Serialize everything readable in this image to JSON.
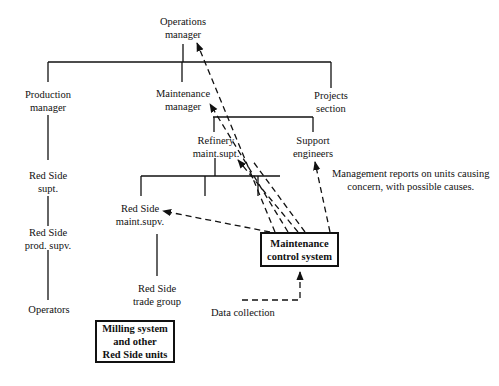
{
  "diagram": {
    "type": "organization-chart-with-information-flows",
    "nodes": {
      "operations_manager": {
        "line1": "Operations",
        "line2": "manager"
      },
      "production_manager": {
        "line1": "Production",
        "line2": "manager"
      },
      "maintenance_manager": {
        "line1": "Maintenance",
        "line2": "manager"
      },
      "projects_section": {
        "line1": "Projects",
        "line2": "section"
      },
      "refinery_maint_supt": {
        "line1": "Refinery",
        "line2": "maint.supt."
      },
      "support_engineers": {
        "line1": "Support",
        "line2": "engineers"
      },
      "red_side_supt": {
        "line1": "Red Side",
        "line2": "supt."
      },
      "red_side_prod_supv": {
        "line1": "Red Side",
        "line2": "prod. supv."
      },
      "operators": {
        "line1": "Operators"
      },
      "red_side_maint_supv": {
        "line1": "Red Side",
        "line2": "maint.supv."
      },
      "red_side_trade_group": {
        "line1": "Red Side",
        "line2": "trade group"
      }
    },
    "boxes": {
      "maintenance_control_system": {
        "line1": "Maintenance",
        "line2": "control system"
      },
      "milling_system": {
        "line1": "Milling system",
        "line2": "and other",
        "line3": "Red Side units"
      }
    },
    "annotations": {
      "management_reports": {
        "line1": "Management reports on units causing",
        "line2": "concern, with possible causes."
      },
      "data_collection": "Data collection"
    },
    "edges_solid": [
      [
        "operations_manager",
        "production_manager"
      ],
      [
        "operations_manager",
        "maintenance_manager"
      ],
      [
        "operations_manager",
        "projects_section"
      ],
      [
        "production_manager",
        "red_side_supt"
      ],
      [
        "red_side_supt",
        "red_side_prod_supv"
      ],
      [
        "red_side_prod_supv",
        "operators"
      ],
      [
        "maintenance_manager",
        "refinery_maint_supt"
      ],
      [
        "maintenance_manager",
        "support_engineers"
      ],
      [
        "refinery_maint_supt",
        "red_side_maint_supv"
      ],
      [
        "red_side_maint_supv",
        "red_side_trade_group"
      ]
    ],
    "edges_dashed_arrows": [
      [
        "maintenance_control_system",
        "operations_manager"
      ],
      [
        "maintenance_control_system",
        "maintenance_manager"
      ],
      [
        "maintenance_control_system",
        "refinery_maint_supt"
      ],
      [
        "maintenance_control_system",
        "support_engineers"
      ],
      [
        "maintenance_control_system",
        "red_side_maint_supv"
      ],
      [
        "data_collection",
        "maintenance_control_system"
      ]
    ]
  }
}
